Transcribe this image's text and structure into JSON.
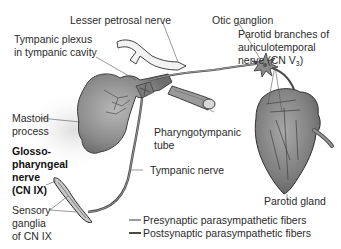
{
  "diagram": {
    "labels": {
      "lesser_petrosal_nerve": "Lesser petrosal nerve",
      "otic_ganglion": "Otic ganglion",
      "tympanic_plexus_line1": "Tympanic plexus",
      "tympanic_plexus_line2": "in tympanic cavity",
      "parotid_branches_line1": "Parotid branches of",
      "parotid_branches_line2": "auriculotemporal",
      "parotid_branches_line3_prefix": "nerve (CN V",
      "parotid_branches_line3_sub": "3",
      "parotid_branches_line3_suffix": ")",
      "mastoid_line1": "Mastoid",
      "mastoid_line2": "process",
      "pharyngotympanic_line1": "Pharyngotympanic",
      "pharyngotympanic_line2": "tube",
      "glosso_line1": "Glosso-",
      "glosso_line2": "pharyngeal",
      "glosso_line3": "nerve",
      "glosso_line4": "(CN IX)",
      "tympanic_nerve": "Tympanic nerve",
      "sensory_line1": "Sensory",
      "sensory_line2": "ganglia",
      "sensory_line3": "of CN IX",
      "parotid_gland": "Parotid gland"
    },
    "legend": [
      {
        "label": "Presynaptic parasympathetic fibers",
        "color": "#9a9a9a"
      },
      {
        "label": "Postsynaptic parasympathetic fibers",
        "color": "#4a4a4a"
      }
    ],
    "colors": {
      "structure_fill": "#8c8c8c",
      "structure_dark": "#555555",
      "nerve_light": "#9a9a9a",
      "nerve_dark": "#4a4a4a",
      "leader_line": "#555555"
    }
  }
}
